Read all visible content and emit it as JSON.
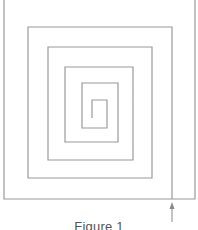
{
  "figure": {
    "caption": "Figure 1",
    "line_color": "#9a9a9a",
    "arrow_color": "#8a8a8a",
    "outer_frame": {
      "left": 4,
      "right": 195,
      "top": 0,
      "bottom": 199
    },
    "spiral_points": [
      [
        92,
        118
      ],
      [
        92,
        100
      ],
      [
        107,
        100
      ],
      [
        107,
        128
      ],
      [
        82,
        128
      ],
      [
        82,
        83
      ],
      [
        118,
        83
      ],
      [
        118,
        142
      ],
      [
        65,
        142
      ],
      [
        65,
        67
      ],
      [
        133,
        67
      ],
      [
        133,
        160
      ],
      [
        48,
        160
      ],
      [
        48,
        47
      ],
      [
        152,
        47
      ],
      [
        152,
        178
      ],
      [
        28,
        178
      ],
      [
        28,
        27
      ],
      [
        172,
        27
      ],
      [
        172,
        199
      ]
    ],
    "arrow": {
      "x": 172,
      "tip_y": 202,
      "tail_y": 222,
      "direction": "up"
    }
  }
}
